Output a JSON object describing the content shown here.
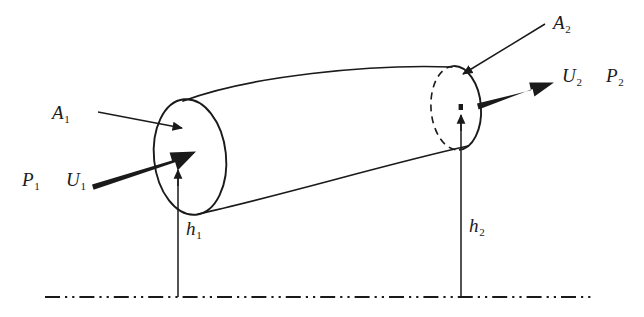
{
  "figure": {
    "type": "physics-diagram",
    "background_color": "#ffffff",
    "line_color": "#1a1a1a",
    "width": 644,
    "height": 317
  },
  "labels": {
    "area_inlet": {
      "symbol": "A",
      "subscript": "1",
      "x": 52,
      "y": 103
    },
    "area_outlet": {
      "symbol": "A",
      "subscript": "2",
      "x": 553,
      "y": 13
    },
    "pressure_inlet": {
      "symbol": "P",
      "subscript": "1",
      "x": 22,
      "y": 170
    },
    "velocity_inlet": {
      "symbol": "U",
      "subscript": "1",
      "x": 66,
      "y": 170
    },
    "velocity_outlet": {
      "symbol": "U",
      "subscript": "2",
      "x": 562,
      "y": 66
    },
    "pressure_outlet": {
      "symbol": "P",
      "subscript": "2",
      "x": 606,
      "y": 66
    },
    "height_inlet": {
      "symbol": "h",
      "subscript": "1",
      "x": 186,
      "y": 219
    },
    "height_outlet": {
      "symbol": "h",
      "subscript": "2",
      "x": 469,
      "y": 216
    }
  },
  "geometry": {
    "inlet_face": {
      "name": "inlet-cross-section-ellipse",
      "center_x": 190,
      "center_y": 157,
      "radius_x": 36,
      "radius_y": 58,
      "style": "solid"
    },
    "outlet_face": {
      "name": "outlet-cross-section-ellipse",
      "center_x": 456,
      "center_y": 108,
      "radius_x": 25,
      "radius_y": 42,
      "front_style": "solid",
      "back_style": "dashed"
    },
    "datum_line": {
      "name": "datum-reference-line",
      "y": 297,
      "x_start": 45,
      "x_end": 592,
      "pattern": "dash-dot-dot"
    },
    "height_line_inlet": {
      "x": 178,
      "y_top": 170,
      "y_bottom": 297
    },
    "height_line_outlet": {
      "x": 461,
      "y_top": 115,
      "y_bottom": 297
    }
  },
  "arrows": {
    "area_inlet_pointer": {
      "name": "A1-leader-arrow",
      "from_x": 98,
      "from_y": 112,
      "to_x": 182,
      "to_y": 128,
      "weight": "thin"
    },
    "area_outlet_pointer": {
      "name": "A2-leader-arrow",
      "from_x": 545,
      "from_y": 24,
      "to_x": 463,
      "to_y": 74,
      "weight": "thin"
    },
    "velocity_inlet_vector": {
      "name": "U1-velocity-arrow",
      "from_x": 92,
      "from_y": 181,
      "to_x": 193,
      "to_y": 152,
      "weight": "thick"
    },
    "velocity_outlet_vector": {
      "name": "U2-velocity-arrow",
      "from_x": 477,
      "from_y": 101,
      "to_x": 551,
      "to_y": 83,
      "weight": "thick"
    },
    "height_inlet_vector": {
      "name": "h1-elevation-arrow",
      "to_x": 178,
      "to_y": 170,
      "weight": "thin-up"
    },
    "height_outlet_vector": {
      "name": "h2-elevation-arrow",
      "to_x": 461,
      "to_y": 115,
      "weight": "thin-up"
    }
  }
}
